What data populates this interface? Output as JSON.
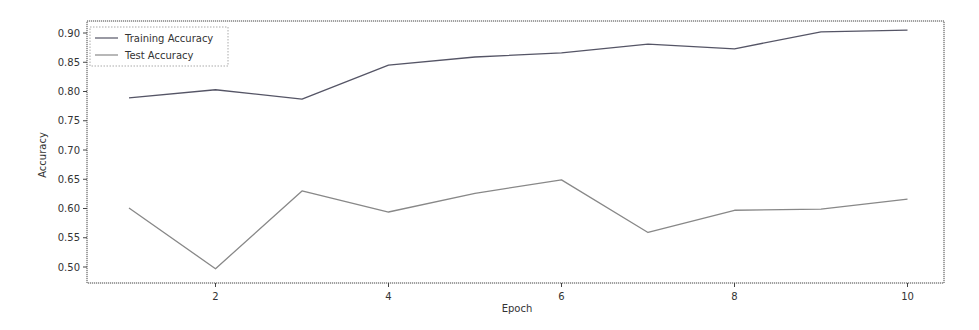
{
  "chart_data": {
    "type": "line",
    "title": "",
    "xlabel": "Epoch",
    "ylabel": "Accuracy",
    "x": [
      1,
      2,
      3,
      4,
      5,
      6,
      7,
      8,
      9,
      10
    ],
    "series": [
      {
        "name": "Training Accuracy",
        "color": "#555566",
        "values": [
          0.789,
          0.803,
          0.787,
          0.845,
          0.859,
          0.866,
          0.881,
          0.873,
          0.902,
          0.905
        ]
      },
      {
        "name": "Test Accuracy",
        "color": "#888888",
        "values": [
          0.601,
          0.497,
          0.63,
          0.594,
          0.626,
          0.649,
          0.559,
          0.597,
          0.599,
          0.616
        ]
      }
    ],
    "xticks": [
      2,
      4,
      6,
      8,
      10
    ],
    "xtick_labels": [
      "2",
      "4",
      "6",
      "8",
      "10"
    ],
    "yticks": [
      0.5,
      0.55,
      0.6,
      0.65,
      0.7,
      0.75,
      0.8,
      0.85,
      0.9
    ],
    "ytick_labels": [
      "0.50",
      "0.55",
      "0.60",
      "0.65",
      "0.70",
      "0.75",
      "0.80",
      "0.85",
      "0.90"
    ],
    "xlim": [
      0.55,
      10.45
    ],
    "ylim": [
      0.472,
      0.919
    ],
    "grid": false,
    "legend_position": "upper left"
  }
}
